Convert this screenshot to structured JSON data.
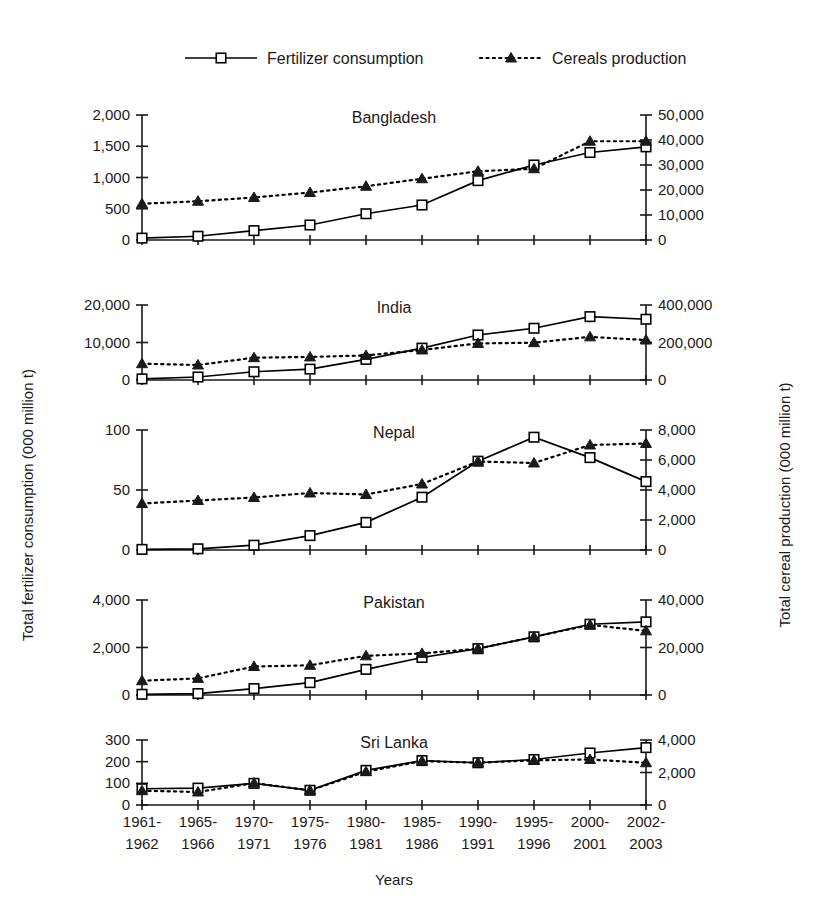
{
  "figure": {
    "xlabel": "Years",
    "ylabel_left": "Total fertilizer consumption (000 million t)",
    "ylabel_right": "Total cereal production (000 million t)"
  },
  "legend": {
    "items": [
      {
        "label": "Fertilizer consumption",
        "marker": "square",
        "line": "solid"
      },
      {
        "label": "Cereals production",
        "marker": "triangle",
        "line": "dotted"
      }
    ]
  },
  "chart_data": {
    "type": "line",
    "title": "",
    "xlabel": "Years",
    "ylabel": "Total fertilizer consumption (000 million t)",
    "ylabel_right": "Total cereal production (000 million t)",
    "grid": false,
    "legend_position": "top",
    "categories": [
      "1961-1962",
      "1965-1966",
      "1970-1971",
      "1975-1976",
      "1980-1981",
      "1985-1986",
      "1990-1991",
      "1995-1996",
      "2000-2001",
      "2002-2003"
    ],
    "categories_lines": [
      [
        "1961-",
        "1962"
      ],
      [
        "1965-",
        "1966"
      ],
      [
        "1970-",
        "1971"
      ],
      [
        "1975-",
        "1976"
      ],
      [
        "1980-",
        "1981"
      ],
      [
        "1985-",
        "1986"
      ],
      [
        "1990-",
        "1991"
      ],
      [
        "1995-",
        "1996"
      ],
      [
        "2000-",
        "2001"
      ],
      [
        "2002-",
        "2003"
      ]
    ],
    "panels": [
      {
        "title": "Bangladesh",
        "ylim_left": [
          0,
          2000
        ],
        "yticks_left": [
          0,
          500,
          1000,
          1500,
          2000
        ],
        "yticklabels_left": [
          "0",
          "500",
          "1,000",
          "1,500",
          "2,000"
        ],
        "ylim_right": [
          0,
          50000
        ],
        "yticks_right": [
          0,
          10000,
          20000,
          30000,
          40000,
          50000
        ],
        "yticklabels_right": [
          "0",
          "10,000",
          "20,000",
          "30,000",
          "40,000",
          "50,000"
        ],
        "series": [
          {
            "name": "Fertilizer consumption",
            "axis": "left",
            "values": [
              30,
              60,
              150,
              240,
              420,
              560,
              950,
              1200,
              1400,
              1490
            ]
          },
          {
            "name": "Cereals production",
            "axis": "right",
            "values": [
              14500,
              15500,
              17000,
              19000,
              21500,
              24500,
              27500,
              28500,
              39500,
              39500
            ]
          }
        ]
      },
      {
        "title": "India",
        "ylim_left": [
          0,
          20000
        ],
        "yticks_left": [
          0,
          10000,
          20000
        ],
        "yticklabels_left": [
          "0",
          "10,000",
          "20,000"
        ],
        "ylim_right": [
          0,
          400000
        ],
        "yticks_right": [
          0,
          200000,
          400000
        ],
        "yticklabels_right": [
          "0",
          "200,000",
          "400,000"
        ],
        "series": [
          {
            "name": "Fertilizer consumption",
            "axis": "left",
            "values": [
              300,
              800,
              2200,
              2900,
              5500,
              8500,
              12000,
              13800,
              16900,
              16200
            ]
          },
          {
            "name": "Cereals production",
            "axis": "right",
            "values": [
              87000,
              80000,
              119000,
              123000,
              131000,
              160000,
              195000,
              199000,
              230000,
              213000
            ]
          }
        ]
      },
      {
        "title": "Nepal",
        "ylim_left": [
          0,
          100
        ],
        "yticks_left": [
          0,
          50,
          100
        ],
        "yticklabels_left": [
          "0",
          "50",
          "100"
        ],
        "ylim_right": [
          0,
          8000
        ],
        "yticks_right": [
          0,
          2000,
          4000,
          6000,
          8000
        ],
        "yticklabels_right": [
          "0",
          "2,000",
          "4,000",
          "6,000",
          "8,000"
        ],
        "series": [
          {
            "name": "Fertilizer consumption",
            "axis": "left",
            "values": [
              0.5,
              1,
              4,
              12,
              23,
              44,
              74,
              94,
              77,
              57
            ]
          },
          {
            "name": "Cereals production",
            "axis": "right",
            "values": [
              3100,
              3300,
              3500,
              3800,
              3700,
              4400,
              5900,
              5800,
              7000,
              7100
            ]
          }
        ]
      },
      {
        "title": "Pakistan",
        "ylim_left": [
          0,
          4000
        ],
        "yticks_left": [
          0,
          2000,
          4000
        ],
        "yticklabels_left": [
          "0",
          "2,000",
          "4,000"
        ],
        "ylim_right": [
          0,
          40000
        ],
        "yticks_right": [
          0,
          20000,
          40000
        ],
        "yticklabels_right": [
          "0",
          "20,000",
          "40,000"
        ],
        "series": [
          {
            "name": "Fertilizer consumption",
            "axis": "left",
            "values": [
              30,
              60,
              270,
              520,
              1080,
              1580,
              1950,
              2450,
              2980,
              3080
            ]
          },
          {
            "name": "Cereals production",
            "axis": "right",
            "values": [
              6000,
              7000,
              12000,
              12500,
              16500,
              17500,
              19500,
              24500,
              29500,
              27000
            ]
          }
        ]
      },
      {
        "title": "Sri Lanka",
        "ylim_left": [
          0,
          300
        ],
        "yticks_left": [
          0,
          100,
          200,
          300
        ],
        "yticklabels_left": [
          "0",
          "100",
          "200",
          "300"
        ],
        "ylim_right": [
          0,
          4000
        ],
        "yticks_right": [
          0,
          2000,
          4000
        ],
        "yticklabels_right": [
          "0",
          "2,000",
          "4,000"
        ],
        "series": [
          {
            "name": "Fertilizer consumption",
            "axis": "left",
            "values": [
              75,
              78,
              100,
              68,
              160,
              205,
              195,
              210,
              240,
              265
            ]
          },
          {
            "name": "Cereals production",
            "axis": "right",
            "values": [
              880,
              800,
              1350,
              900,
              2050,
              2700,
              2600,
              2750,
              2800,
              2600
            ]
          }
        ]
      }
    ]
  }
}
